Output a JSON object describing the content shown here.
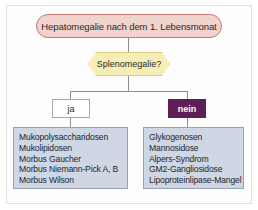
{
  "figure": {
    "type": "clinical-decision-flowchart",
    "language": "de"
  },
  "colors": {
    "root_fill": "#f0d3cd",
    "root_border": "#c4767a",
    "decision_fill": "#f7edb7",
    "decision_border": "#e0c97a",
    "outcome_fill": "#ced7e3",
    "outcome_border": "#97a3b5",
    "branch_no_fill": "#5e1f56",
    "connector": "#8e8e8e",
    "page_background": "#ffffff",
    "frame_border": "#e2e2e2"
  },
  "root": {
    "label": "Hepatomegalie nach dem 1. Lebensmonat"
  },
  "decision": {
    "label": "Splenomegalie?"
  },
  "branches": {
    "yes": {
      "label": "ja"
    },
    "no": {
      "label": "nein"
    }
  },
  "outcomes": {
    "yes_branch": {
      "items": [
        "Mukopolysaccharidosen",
        "Mukolipidosen",
        "Morbus Gaucher",
        "Morbus Niemann-Pick A, B",
        "Morbus Wilson"
      ]
    },
    "no_branch": {
      "items": [
        "Glykogenosen",
        "Mannosidose",
        "Alpers-Syndrom",
        "GM2-Gangliosidose",
        "Lipoproteinlipase-Mangel"
      ]
    }
  }
}
